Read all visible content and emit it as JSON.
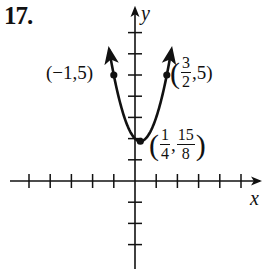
{
  "problem": {
    "number": "17."
  },
  "axes": {
    "x_label": "x",
    "y_label": "y",
    "origin_px": [
      135,
      181
    ],
    "unit_px": 21.2,
    "x_ticks": [
      -5,
      -4,
      -3,
      -2,
      -1,
      1,
      2,
      3,
      4,
      5
    ],
    "y_ticks": [
      -3,
      -2,
      -1,
      1,
      2,
      3,
      4,
      5,
      6,
      7
    ]
  },
  "points": [
    {
      "label": "(−1,5)",
      "x": -1,
      "y": 5
    },
    {
      "label_num_x": "3",
      "label_den_x": "2",
      "label_y": "5",
      "x": 1.5,
      "y": 5
    },
    {
      "label_num_x": "1",
      "label_den_x": "4",
      "label_num_y": "15",
      "label_den_y": "8",
      "x": 0.25,
      "y": 1.875,
      "role": "vertex"
    }
  ],
  "labels": {
    "left_point": "(−1,5)",
    "right_open": "(",
    "right_num": "3",
    "right_den": "2",
    "right_rest": ",5)",
    "vertex_open": "(",
    "vertex_xnum": "1",
    "vertex_xden": "4",
    "vertex_comma": ",",
    "vertex_ynum": "15",
    "vertex_yden": "8",
    "vertex_close": ")"
  },
  "chart_data": {
    "type": "line",
    "title": "17.",
    "xlabel": "x",
    "ylabel": "y",
    "function": "y = 2x^2 - x + 2",
    "xlim": [
      -5.5,
      6
    ],
    "ylim": [
      -4,
      8
    ],
    "grid": false,
    "series": [
      {
        "name": "parabola",
        "x": [
          -1.2,
          -1,
          -0.5,
          0,
          0.25,
          0.5,
          1,
          1.5,
          1.7
        ],
        "y": [
          6.08,
          5,
          3,
          2,
          1.875,
          2,
          3,
          5,
          6.08
        ]
      }
    ],
    "annotations": [
      {
        "point": [
          -1,
          5
        ],
        "text": "(−1,5)"
      },
      {
        "point": [
          1.5,
          5
        ],
        "text": "(3/2, 5)"
      },
      {
        "point": [
          0.25,
          1.875
        ],
        "text": "(1/4, 15/8)"
      }
    ]
  }
}
